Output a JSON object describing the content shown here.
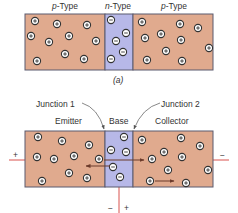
{
  "diagram_a": {
    "labels": {
      "left": "p-Type",
      "middle": "n-Type",
      "right": "p-Type"
    },
    "caption": "(a)",
    "holes_left": [
      [
        35,
        21
      ],
      [
        57,
        24
      ],
      [
        87,
        25
      ],
      [
        31,
        36
      ],
      [
        49,
        42
      ],
      [
        69,
        36
      ],
      [
        96,
        41
      ],
      [
        65,
        54
      ],
      [
        84,
        59
      ],
      [
        37,
        61
      ]
    ],
    "electrons_middle": [
      [
        111,
        20
      ],
      [
        126,
        33
      ],
      [
        116,
        41
      ],
      [
        123,
        52
      ],
      [
        111,
        59
      ]
    ],
    "holes_right": [
      [
        142,
        22
      ],
      [
        180,
        24
      ],
      [
        198,
        28
      ],
      [
        145,
        38
      ],
      [
        161,
        34
      ],
      [
        181,
        40
      ],
      [
        209,
        48
      ],
      [
        166,
        51
      ],
      [
        147,
        60
      ],
      [
        182,
        61
      ]
    ]
  },
  "diagram_b": {
    "labels": {
      "junction1": "Junction 1",
      "junction2": "Junction 2",
      "emitter": "Emitter",
      "base": "Base",
      "collector": "Collector"
    },
    "emitter_bias": {
      "left_sign": "+",
      "right_sign": "−"
    },
    "base_bias": {
      "minus": "−",
      "plus": "+"
    },
    "holes_emitter": [
      [
        38,
        137
      ],
      [
        62,
        141
      ],
      [
        89,
        145
      ],
      [
        37,
        157
      ],
      [
        54,
        159
      ],
      [
        74,
        156
      ],
      [
        99,
        159
      ],
      [
        69,
        173
      ],
      [
        87,
        178
      ],
      [
        42,
        181
      ]
    ],
    "electrons_base": [
      [
        124,
        137
      ],
      [
        111,
        150
      ],
      [
        126,
        152
      ],
      [
        113,
        167
      ],
      [
        120,
        177
      ]
    ],
    "holes_collector": [
      [
        142,
        140
      ],
      [
        181,
        138
      ],
      [
        200,
        146
      ],
      [
        152,
        159
      ],
      [
        164,
        152
      ],
      [
        182,
        157
      ],
      [
        208,
        170
      ],
      [
        168,
        170
      ],
      [
        150,
        181
      ],
      [
        186,
        183
      ]
    ],
    "arrows": [
      {
        "from": [
          104,
          160
        ],
        "to": [
          144,
          160
        ],
        "name": "hole-injection-arrow"
      },
      {
        "from": [
          110,
          166
        ],
        "to": [
          86,
          166
        ],
        "name": "electron-flow-arrow"
      },
      {
        "from": [
          155,
          181
        ],
        "to": [
          174,
          181
        ],
        "name": "collector-hole-arrow"
      }
    ]
  },
  "colors": {
    "p_region": "#e0aa8e",
    "n_region": "#b7b8e8",
    "border": "#5b5a6e",
    "lead": "#d9534f",
    "arrow": "#6b3a2a"
  }
}
